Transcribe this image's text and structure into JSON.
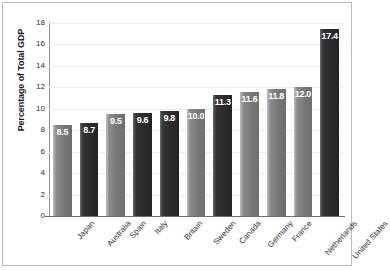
{
  "chart_data": {
    "type": "bar",
    "title": "",
    "xlabel": "",
    "ylabel": "Percentage of Total GDP",
    "ylim": [
      0,
      18
    ],
    "ytick_step": 2,
    "yticks": [
      "0",
      "2",
      "4",
      "6",
      "8",
      "10",
      "12",
      "14",
      "16",
      "18"
    ],
    "grid": true,
    "legend": "none",
    "categories": [
      "Japan",
      "Australia",
      "Spain",
      "Italy",
      "Britain",
      "Sweden",
      "Canada",
      "Germany",
      "France",
      "Netherlands",
      "United States"
    ],
    "values": [
      8.5,
      8.7,
      9.5,
      9.6,
      9.8,
      10.0,
      11.3,
      11.6,
      11.8,
      12.0,
      17.4
    ],
    "value_labels": [
      "8.5",
      "8.7",
      "9.5",
      "9.6",
      "9.8",
      "10.0",
      "11.3",
      "11.6",
      "11.8",
      "12.0",
      "17.4"
    ],
    "bar_shades": [
      "light",
      "dark",
      "light",
      "dark",
      "dark",
      "light",
      "dark",
      "light",
      "light",
      "light",
      "dark"
    ],
    "colors": {
      "bar_light": "#787878",
      "bar_dark": "#2c2c2c",
      "value_label": "#ffffff",
      "gridline": "#ececec",
      "axis": "#8d8d8d",
      "frame": "#b9b9b9",
      "background": "#ffffff",
      "tick_text": "#2b2b2b"
    }
  }
}
